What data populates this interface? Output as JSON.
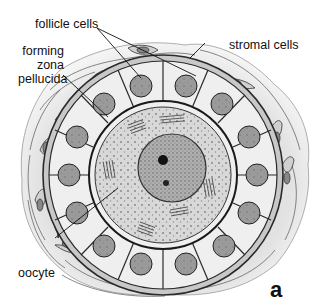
{
  "figure": {
    "panel_letter": "a",
    "labels": {
      "follicle_cells": "follicle cells",
      "forming_zona_pellucida": [
        "forming",
        "zona",
        "pellucida"
      ],
      "stromal_cells": "stromal cells",
      "oocyte": "oocyte"
    },
    "colors": {
      "stroma_fill": "#e4e4e4",
      "follicle_cell_fill": "#f0f0f0",
      "nucleus_fill": "#9a9a9a",
      "oocyte_cytoplasm_fill": "#d8d8d8",
      "oocyte_nucleus_fill": "#a8a8a8",
      "outline": "#2a2a2a",
      "text": "#111111"
    }
  }
}
